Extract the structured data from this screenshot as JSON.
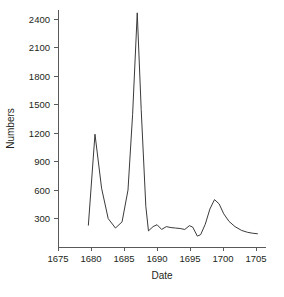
{
  "chart_data": {
    "type": "line",
    "title": "",
    "subtitle": "",
    "xlabel": "Date",
    "ylabel": "Numbers",
    "xlim": [
      1675,
      1706.5
    ],
    "ylim": [
      0,
      2500
    ],
    "xticks": [
      1675,
      1680,
      1685,
      1690,
      1695,
      1700,
      1705
    ],
    "xtick_labels": [
      "1675",
      "1680",
      "1685",
      "1690",
      "1695",
      "1700",
      "1705"
    ],
    "yticks": [
      300,
      600,
      900,
      1200,
      1500,
      1800,
      2100,
      2400
    ],
    "ytick_labels": [
      "300",
      "600",
      "900",
      "1200",
      "1500",
      "1800",
      "2100",
      "2400"
    ],
    "grid": false,
    "legend": false,
    "legend_position": "none",
    "line_color": "#3a3a3a",
    "axis_color": "#58595b",
    "text_color": "#231f20",
    "background_color": "#ffffff",
    "series": [
      {
        "name": "Numbers",
        "x": [
          1679.6,
          1680.6,
          1681.6,
          1682.6,
          1683.7,
          1684.7,
          1685.6,
          1686.3,
          1687.0,
          1687.6,
          1688.3,
          1688.7,
          1689.4,
          1690.0,
          1690.7,
          1691.4,
          1692.1,
          1692.8,
          1693.5,
          1694.2,
          1694.9,
          1695.4,
          1696.1,
          1696.6,
          1697.3,
          1698.0,
          1698.7,
          1699.4,
          1700.1,
          1700.9,
          1701.8,
          1702.8,
          1703.7,
          1704.5,
          1705.2
        ],
        "y": [
          230,
          1190,
          620,
          300,
          200,
          265,
          600,
          1400,
          2470,
          1450,
          430,
          170,
          215,
          235,
          185,
          215,
          205,
          200,
          195,
          185,
          225,
          210,
          115,
          130,
          240,
          400,
          500,
          455,
          350,
          270,
          215,
          175,
          155,
          145,
          140
        ]
      }
    ]
  }
}
